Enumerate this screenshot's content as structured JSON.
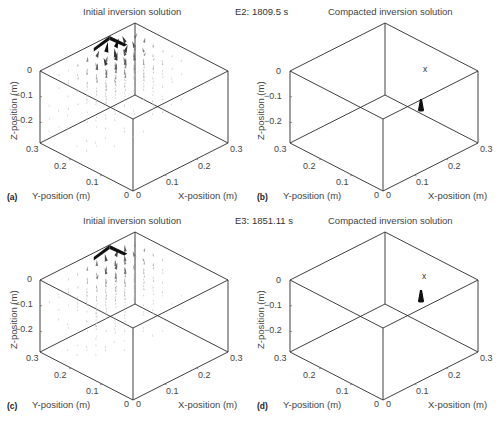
{
  "figure": {
    "panels": [
      {
        "id": "a",
        "letter": "(a)",
        "title": "Initial inversion solution",
        "type": "initial",
        "event_label": "E2: 1809.5 s",
        "origin": [
          133,
          191
        ],
        "ylabel": "Y-position (m)",
        "xlabel": "X-position (m)",
        "zlabel": "Z-position (m)",
        "y_ticks": [
          "0.3",
          "0.2",
          "0.1",
          "0"
        ],
        "x_ticks": [
          "0",
          "0.1",
          "0.2",
          "0.3"
        ],
        "z_ticks": [
          "0",
          "-0.1",
          "-0.2"
        ]
      },
      {
        "id": "b",
        "letter": "(b)",
        "title": "Compacted inversion solution",
        "type": "compacted",
        "origin": [
          383,
          191
        ],
        "marker_label": "x",
        "ylabel": "Y-position (m)",
        "xlabel": "X-position (m)",
        "zlabel": "Z-position (m)",
        "y_ticks": [
          "0.3",
          "0.2",
          "0.1",
          "0"
        ],
        "x_ticks": [
          "0",
          "0.1",
          "0.2",
          "0.3"
        ],
        "z_ticks": [
          "0",
          "-0.1",
          "-0.2"
        ]
      },
      {
        "id": "c",
        "letter": "(c)",
        "title": "Initial inversion solution",
        "type": "initial",
        "event_label": "E3: 1851.11 s",
        "origin": [
          133,
          400
        ],
        "ylabel": "Y-position (m)",
        "xlabel": "X-position (m)",
        "zlabel": "Z-position (m)",
        "y_ticks": [
          "0.3",
          "0.2",
          "0.1",
          "0"
        ],
        "x_ticks": [
          "0",
          "0.1",
          "0.2",
          "0.3"
        ],
        "z_ticks": [
          "0",
          "-0.1",
          "-0.2"
        ]
      },
      {
        "id": "d",
        "letter": "(d)",
        "title": "Compacted inversion solution",
        "type": "compacted",
        "origin": [
          383,
          400
        ],
        "marker_label": "x",
        "ylabel": "Y-position (m)",
        "xlabel": "X-position (m)",
        "zlabel": "Z-position (m)",
        "y_ticks": [
          "0.3",
          "0.2",
          "0.1",
          "0"
        ],
        "x_ticks": [
          "0",
          "0.1",
          "0.2",
          "0.3"
        ],
        "z_ticks": [
          "0",
          "-0.1",
          "-0.2"
        ]
      }
    ]
  },
  "chart_data": [
    {
      "type": "scatter",
      "subtype": "3d-quiver",
      "panel": "(a)",
      "title": "Initial inversion solution",
      "annotation": "E2: 1809.5 s",
      "xlabel": "X-position (m)",
      "ylabel": "Y-position (m)",
      "zlabel": "Z-position (m)",
      "xlim": [
        0,
        0.3
      ],
      "ylim": [
        0,
        0.3
      ],
      "zlim": [
        -0.28,
        0
      ],
      "x_ticks": [
        0,
        0.1,
        0.2,
        0.3
      ],
      "y_ticks": [
        0,
        0.1,
        0.2,
        0.3
      ],
      "z_ticks": [
        0,
        -0.1,
        -0.2
      ],
      "description": "Distributed vector field of moment-tensor solutions; strongest vectors clustered near x≈0.15–0.3, y≈0.2–0.3, z≈0 to -0.15",
      "peak_vector_location": [
        0.2,
        0.28,
        -0.02
      ],
      "grid": false,
      "legend": null
    },
    {
      "type": "scatter",
      "subtype": "3d-quiver",
      "panel": "(b)",
      "title": "Compacted inversion solution",
      "xlabel": "X-position (m)",
      "ylabel": "Y-position (m)",
      "zlabel": "Z-position (m)",
      "xlim": [
        0,
        0.3
      ],
      "ylim": [
        0,
        0.3
      ],
      "zlim": [
        -0.28,
        0
      ],
      "x_ticks": [
        0,
        0.1,
        0.2,
        0.3
      ],
      "y_ticks": [
        0,
        0.1,
        0.2,
        0.3
      ],
      "z_ticks": [
        0,
        -0.1,
        -0.2
      ],
      "description": "Single compacted vector (cone) with 'x' marker denoting source location",
      "compact_vector_location": [
        0.21,
        0.2,
        -0.1
      ],
      "marker": "x",
      "grid": false,
      "legend": null
    },
    {
      "type": "scatter",
      "subtype": "3d-quiver",
      "panel": "(c)",
      "title": "Initial inversion solution",
      "annotation": "E3: 1851.11 s",
      "xlabel": "X-position (m)",
      "ylabel": "Y-position (m)",
      "zlabel": "Z-position (m)",
      "xlim": [
        0,
        0.3
      ],
      "ylim": [
        0,
        0.3
      ],
      "zlim": [
        -0.28,
        0
      ],
      "x_ticks": [
        0,
        0.1,
        0.2,
        0.3
      ],
      "y_ticks": [
        0,
        0.1,
        0.2,
        0.3
      ],
      "z_ticks": [
        0,
        -0.1,
        -0.2
      ],
      "description": "Distributed vector field, weaker than (a); strongest vectors near x≈0.2, y≈0.28, z≈0",
      "peak_vector_location": [
        0.2,
        0.28,
        -0.02
      ],
      "grid": false,
      "legend": null
    },
    {
      "type": "scatter",
      "subtype": "3d-quiver",
      "panel": "(d)",
      "title": "Compacted inversion solution",
      "xlabel": "X-position (m)",
      "ylabel": "Y-position (m)",
      "zlabel": "Z-position (m)",
      "xlim": [
        0,
        0.3
      ],
      "ylim": [
        0,
        0.3
      ],
      "zlim": [
        -0.28,
        0
      ],
      "x_ticks": [
        0,
        0.1,
        0.2,
        0.3
      ],
      "y_ticks": [
        0,
        0.1,
        0.2,
        0.3
      ],
      "z_ticks": [
        0,
        -0.1,
        -0.2
      ],
      "description": "Single compacted vector (cone) with 'x' marker denoting source location",
      "compact_vector_location": [
        0.21,
        0.2,
        -0.08
      ],
      "marker": "x",
      "grid": false,
      "legend": null
    }
  ]
}
